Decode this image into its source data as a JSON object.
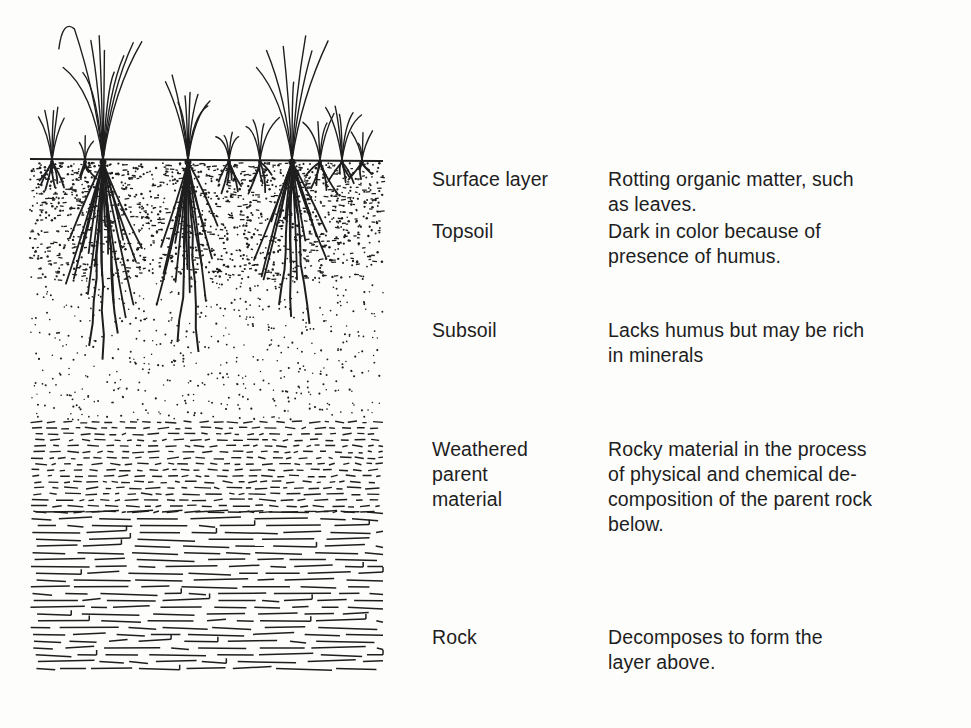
{
  "figure": {
    "illustration_label": "Cross-section of soil with grass plants and roots",
    "colors": {
      "background": "#fdfdfc",
      "ink": "#1e1e1e"
    },
    "layers": [
      {
        "name": "Surface layer",
        "description": "Rotting organic matter, such\nas leaves."
      },
      {
        "name": "Topsoil",
        "description": "Dark in color because of\npresence of humus."
      },
      {
        "name": "Subsoil",
        "description": "Lacks humus but may be rich\nin minerals"
      },
      {
        "name": "Weathered\nparent\nmaterial",
        "description": "Rocky material in the process\nof physical and chemical de-\ncomposition of the parent rock\nbelow."
      },
      {
        "name": "Rock",
        "description": "Decomposes to form the\nlayer above."
      }
    ]
  }
}
